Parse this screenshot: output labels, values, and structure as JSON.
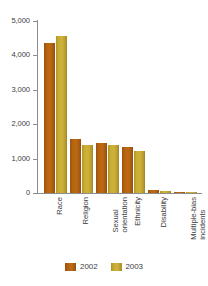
{
  "chart_data": {
    "type": "bar",
    "title": "",
    "subtitle": "",
    "xlabel": "",
    "ylabel": "",
    "ylim": [
      0,
      5000
    ],
    "grid": false,
    "legend_position": "bottom-center",
    "y_ticks": [
      {
        "value": 5000,
        "label": "5,000"
      },
      {
        "value": 4000,
        "label": "4,000"
      },
      {
        "value": 3000,
        "label": "3,000"
      },
      {
        "value": 2000,
        "label": "2,000"
      },
      {
        "value": 1000,
        "label": "1,000"
      },
      {
        "value": 0,
        "label": "0"
      }
    ],
    "categories": [
      {
        "line1": "Race",
        "line2": ""
      },
      {
        "line1": "Religion",
        "line2": ""
      },
      {
        "line1": "Sexual",
        "line2": "orientation"
      },
      {
        "line1": "Ethnicity",
        "line2": ""
      },
      {
        "line1": "Disability",
        "line2": ""
      },
      {
        "line1": "Multiple-bias",
        "line2": "incidents"
      }
    ],
    "series": [
      {
        "name": "2002",
        "color": "#b3620f",
        "values": [
          4350,
          1580,
          1450,
          1330,
          100,
          10
        ]
      },
      {
        "name": "2003",
        "color": "#c9ad33",
        "values": [
          4550,
          1400,
          1400,
          1230,
          70,
          5
        ]
      }
    ]
  },
  "legend": {
    "items": [
      {
        "label": "2002",
        "color": "#b3620f"
      },
      {
        "label": "2003",
        "color": "#c9ad33"
      }
    ]
  },
  "axis": {
    "line_color": "#8d8d8d"
  }
}
